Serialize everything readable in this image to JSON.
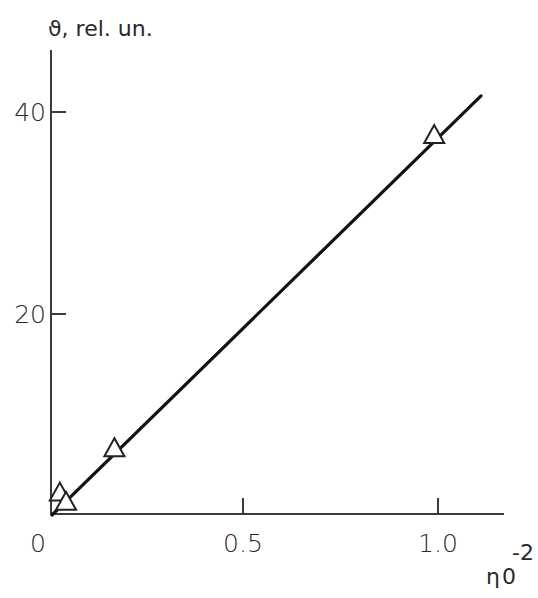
{
  "chart_data": {
    "type": "scatter",
    "title": "",
    "ylabel": "ϑ, rel. un.",
    "xlabel": "η₀⁻²",
    "xlabel_parts": {
      "base": "η",
      "subscript": "0",
      "superscript": "-2"
    },
    "xlim": [
      0,
      1.16
    ],
    "ylim": [
      0,
      46
    ],
    "x_ticks": [
      {
        "value": 0,
        "label": "0"
      },
      {
        "value": 0.5,
        "label": "0.5"
      },
      {
        "value": 1.0,
        "label": "1.0"
      }
    ],
    "y_ticks": [
      {
        "value": 20,
        "label": "20"
      },
      {
        "value": 40,
        "label": "40"
      }
    ],
    "grid": false,
    "legend": null,
    "series": [
      {
        "name": "measured",
        "marker": "open-triangle",
        "points": [
          {
            "x": 0.02,
            "y": 2.2
          },
          {
            "x": 0.036,
            "y": 1.3
          },
          {
            "x": 0.16,
            "y": 6.6
          },
          {
            "x": 0.98,
            "y": 37.6
          }
        ]
      },
      {
        "name": "linear fit",
        "style": "solid-line",
        "points": [
          {
            "x": 0.0,
            "y": 0.0
          },
          {
            "x": 1.1,
            "y": 41.6
          }
        ]
      }
    ],
    "colors": {
      "axis": "#3a3a3a",
      "line": "#111111",
      "marker_stroke": "#222222",
      "marker_fill": "#ffffff"
    }
  }
}
